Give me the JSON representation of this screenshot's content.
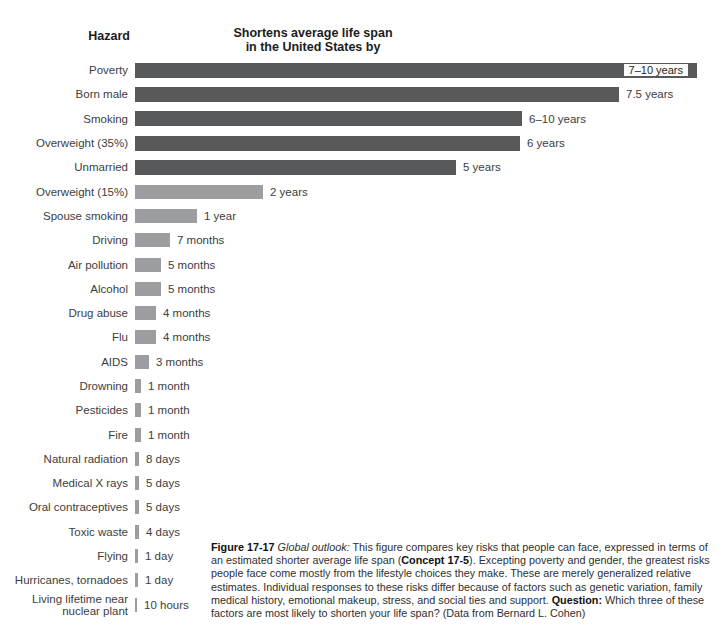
{
  "figure": {
    "category_header": "Hazard",
    "title": "Shortens average life span\nin the United States by"
  },
  "chart_data": {
    "type": "bar",
    "orientation": "horizontal",
    "title": "Shortens average life span in the United States by",
    "category_header": "Hazard",
    "legend": "none",
    "grid": false,
    "colors": {
      "dark_bar": "#58595b",
      "light_bar": "#9b9da0",
      "inside_label_bg": "#fcfcfa"
    },
    "rows": [
      {
        "hazard": "Poverty",
        "duration": "7–10 years",
        "approx_days": 3103,
        "bar_px": 562,
        "shade": "dark",
        "label_inside": true
      },
      {
        "hazard": "Born male",
        "duration": "7.5 years",
        "approx_days": 2738,
        "bar_px": 484,
        "shade": "dark",
        "label_inside": false
      },
      {
        "hazard": "Smoking",
        "duration": "6–10 years",
        "approx_days": 2920,
        "bar_px": 387,
        "shade": "dark",
        "label_inside": false
      },
      {
        "hazard": "Overweight (35%)",
        "duration": "6 years",
        "approx_days": 2190,
        "bar_px": 385,
        "shade": "dark",
        "label_inside": false
      },
      {
        "hazard": "Unmarried",
        "duration": "5 years",
        "approx_days": 1825,
        "bar_px": 321,
        "shade": "dark",
        "label_inside": false
      },
      {
        "hazard": "Overweight (15%)",
        "duration": "2 years",
        "approx_days": 730,
        "bar_px": 128,
        "shade": "light",
        "label_inside": false
      },
      {
        "hazard": "Spouse smoking",
        "duration": "1 year",
        "approx_days": 365,
        "bar_px": 62,
        "shade": "light",
        "label_inside": false
      },
      {
        "hazard": "Driving",
        "duration": "7 months",
        "approx_days": 213,
        "bar_px": 35,
        "shade": "light",
        "label_inside": false
      },
      {
        "hazard": "Air pollution",
        "duration": "5 months",
        "approx_days": 152,
        "bar_px": 26,
        "shade": "light",
        "label_inside": false
      },
      {
        "hazard": "Alcohol",
        "duration": "5 months",
        "approx_days": 152,
        "bar_px": 26,
        "shade": "light",
        "label_inside": false
      },
      {
        "hazard": "Drug abuse",
        "duration": "4 months",
        "approx_days": 122,
        "bar_px": 21,
        "shade": "light",
        "label_inside": false
      },
      {
        "hazard": "Flu",
        "duration": "4 months",
        "approx_days": 122,
        "bar_px": 21,
        "shade": "light",
        "label_inside": false
      },
      {
        "hazard": "AIDS",
        "duration": "3 months",
        "approx_days": 91,
        "bar_px": 14,
        "shade": "light",
        "label_inside": false
      },
      {
        "hazard": "Drowning",
        "duration": "1 month",
        "approx_days": 30,
        "bar_px": 6,
        "shade": "light",
        "label_inside": false
      },
      {
        "hazard": "Pesticides",
        "duration": "1 month",
        "approx_days": 30,
        "bar_px": 6,
        "shade": "light",
        "label_inside": false
      },
      {
        "hazard": "Fire",
        "duration": "1 month",
        "approx_days": 30,
        "bar_px": 6,
        "shade": "light",
        "label_inside": false
      },
      {
        "hazard": "Natural radiation",
        "duration": "8 days",
        "approx_days": 8,
        "bar_px": 4,
        "shade": "light",
        "label_inside": false
      },
      {
        "hazard": "Medical X rays",
        "duration": "5 days",
        "approx_days": 5,
        "bar_px": 4,
        "shade": "light",
        "label_inside": false
      },
      {
        "hazard": "Oral contraceptives",
        "duration": "5 days",
        "approx_days": 5,
        "bar_px": 4,
        "shade": "light",
        "label_inside": false
      },
      {
        "hazard": "Toxic waste",
        "duration": "4 days",
        "approx_days": 4,
        "bar_px": 4,
        "shade": "light",
        "label_inside": false
      },
      {
        "hazard": "Flying",
        "duration": "1 day",
        "approx_days": 1,
        "bar_px": 3,
        "shade": "light",
        "label_inside": false
      },
      {
        "hazard": "Hurricanes, tornadoes",
        "duration": "1 day",
        "approx_days": 1,
        "bar_px": 3,
        "shade": "light",
        "label_inside": false
      },
      {
        "hazard": "Living lifetime near\nnuclear plant",
        "duration": "10 hours",
        "approx_days": 0.4,
        "bar_px": 2,
        "shade": "light",
        "label_inside": false
      }
    ]
  },
  "caption": {
    "segments": [
      {
        "t": "Figure 17-17 ",
        "b": true
      },
      {
        "t": "Global outlook:",
        "i": true
      },
      {
        "t": "  This figure compares key risks that people can face, expressed in terms of an estimated shorter average life span ("
      },
      {
        "t": "Concept 17-5",
        "b": true
      },
      {
        "t": "). Excepting poverty and gender, the greatest risks people face come mostly from the lifestyle choices they make. These are merely generalized relative estimates. Individual responses to these risks differ because of factors such as genetic variation, family medical history, emotional makeup, stress, and social ties and support. "
      },
      {
        "t": "Question:",
        "b": true
      },
      {
        "t": " Which three of these factors are most likely to shorten your life span? (Data from Bernard L. Cohen)"
      }
    ]
  }
}
